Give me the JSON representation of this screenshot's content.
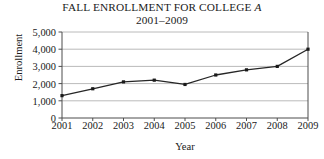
{
  "chart_data": {
    "type": "line",
    "title": "FALL ENROLLMENT FOR COLLEGE ",
    "title_italic_suffix": "A",
    "subtitle": "2001–2009",
    "xlabel": "Year",
    "ylabel": "Enrollment",
    "categories": [
      "2001",
      "2002",
      "2003",
      "2004",
      "2005",
      "2006",
      "2007",
      "2008",
      "2009"
    ],
    "values": [
      1300,
      1700,
      2100,
      2200,
      1950,
      2500,
      2800,
      3000,
      4000
    ],
    "series": [
      {
        "name": "Enrollment",
        "values": [
          1300,
          1700,
          2100,
          2200,
          1950,
          2500,
          2800,
          3000,
          4000
        ]
      }
    ],
    "ylim": [
      0,
      5000
    ],
    "ytick_values": [
      0,
      1000,
      2000,
      3000,
      4000,
      5000
    ],
    "ytick_labels": [
      "0",
      "1,000",
      "2,000",
      "3,000",
      "4,000",
      "5,000"
    ],
    "grid": "horizontal",
    "legend": "none",
    "line_color": "#262626",
    "marker_color": "#1a1a1a",
    "grid_color": "#a8a8a8",
    "axis_color": "#4d4d4d",
    "background_color": "#ffffff"
  }
}
